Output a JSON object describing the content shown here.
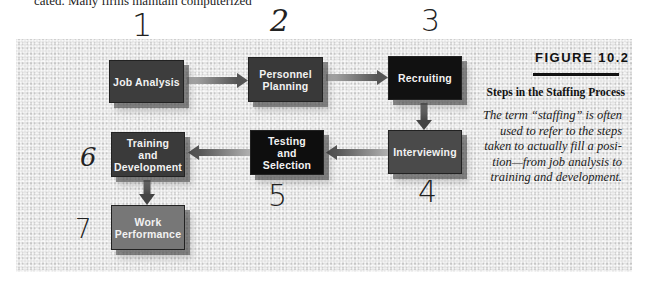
{
  "page": {
    "top_text": "cated. Many firms maintain computerized"
  },
  "diagram": {
    "title": "Steps in the Staffing Process",
    "figure_label": "FIGURE 10.2",
    "caption": "The term “staffing” is often used to refer to the steps taken to actually fill a position—from job analysis to training and development.",
    "caption_lines": [
      "The term “staffing” is often",
      "used to refer to the steps",
      "taken to actually fill a posi-",
      "tion—from job analysis to",
      "training and development."
    ],
    "nodes": [
      {
        "id": "job-analysis",
        "lines": [
          "Job Analysis"
        ],
        "step": "1",
        "color": "#3d3d3d"
      },
      {
        "id": "personnel-planning",
        "lines": [
          "Personnel",
          "Planning"
        ],
        "step": "2",
        "color": "#393939"
      },
      {
        "id": "recruiting",
        "lines": [
          "Recruiting"
        ],
        "step": "3",
        "color": "#111111"
      },
      {
        "id": "interviewing",
        "lines": [
          "Interviewing"
        ],
        "step": "4",
        "color": "#4a4a4a"
      },
      {
        "id": "testing-selection",
        "lines": [
          "Testing",
          "and",
          "Selection"
        ],
        "step": "5",
        "color": "#0e0e0e"
      },
      {
        "id": "training-development",
        "lines": [
          "Training",
          "and",
          "Development"
        ],
        "step": "6",
        "color": "#3a3a3a"
      },
      {
        "id": "work-performance",
        "lines": [
          "Work",
          "Performance"
        ],
        "step": "7",
        "color": "#777777"
      }
    ],
    "edges": [
      {
        "from": "job-analysis",
        "to": "personnel-planning"
      },
      {
        "from": "personnel-planning",
        "to": "recruiting"
      },
      {
        "from": "recruiting",
        "to": "interviewing"
      },
      {
        "from": "interviewing",
        "to": "testing-selection"
      },
      {
        "from": "testing-selection",
        "to": "training-development"
      },
      {
        "from": "training-development",
        "to": "work-performance"
      }
    ],
    "handwritten_numbers": [
      "1",
      "2",
      "3",
      "4",
      "5",
      "6",
      "7"
    ]
  }
}
